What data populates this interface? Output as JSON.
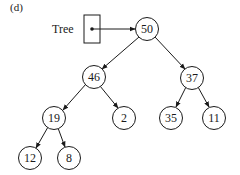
{
  "figure": {
    "label": "(d)",
    "pointer_label": "Tree"
  },
  "tree": {
    "root": "50",
    "nodes": [
      {
        "id": "n50",
        "value": "50",
        "x": 147,
        "y": 29
      },
      {
        "id": "n46",
        "value": "46",
        "x": 94,
        "y": 77
      },
      {
        "id": "n37",
        "value": "37",
        "x": 192,
        "y": 78
      },
      {
        "id": "n19",
        "value": "19",
        "x": 54,
        "y": 118
      },
      {
        "id": "n2",
        "value": "2",
        "x": 124,
        "y": 118
      },
      {
        "id": "n35",
        "value": "35",
        "x": 171,
        "y": 118
      },
      {
        "id": "n11",
        "value": "11",
        "x": 214,
        "y": 118
      },
      {
        "id": "n12",
        "value": "12",
        "x": 30,
        "y": 158
      },
      {
        "id": "n8",
        "value": "8",
        "x": 69,
        "y": 158
      }
    ],
    "edges": [
      {
        "from": "50",
        "to": "46"
      },
      {
        "from": "50",
        "to": "37"
      },
      {
        "from": "46",
        "to": "19"
      },
      {
        "from": "46",
        "to": "2"
      },
      {
        "from": "37",
        "to": "35"
      },
      {
        "from": "37",
        "to": "11"
      },
      {
        "from": "19",
        "to": "12"
      },
      {
        "from": "19",
        "to": "8"
      }
    ]
  }
}
